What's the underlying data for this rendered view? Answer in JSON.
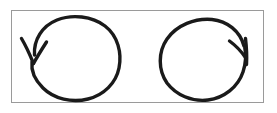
{
  "image": {
    "title": "Two circular rotation arrows",
    "description": "Hand-drawn diagram of two circles, each with an arrowhead indicating direction of rotation, enclosed in a thin rectangular frame.",
    "width": 277,
    "height": 113,
    "background_color": "#ffffff"
  },
  "frame": {
    "name": "bounding-rectangle",
    "x": 11,
    "y": 10,
    "width": 253,
    "height": 93,
    "stroke_color": "#9a9a9a",
    "stroke_width": 1,
    "fill_color": "#ffffff"
  },
  "style": {
    "ink_color": "#1a1a1a",
    "stroke_width": 3.4,
    "stroke_linecap": "round",
    "stroke_linejoin": "round"
  },
  "figures": [
    {
      "id": "left-circle-arrow",
      "label": "counterclockwise rotation arrow",
      "direction": "counterclockwise",
      "center_x": 77,
      "center_y": 59,
      "radius_x": 43,
      "radius_y": 42,
      "arrowhead": {
        "name": "arrowhead-down-left",
        "tip_x": 33,
        "tip_y": 62,
        "barb_one_x": 21,
        "barb_one_y": 38,
        "barb_two_x": 46,
        "barb_two_y": 42,
        "points_toward": "down-left"
      }
    },
    {
      "id": "right-circle-arrow",
      "label": "clockwise rotation arrow",
      "direction": "clockwise",
      "center_x": 202,
      "center_y": 61,
      "radius_x": 43,
      "radius_y": 41,
      "arrowhead": {
        "name": "arrowhead-up-right",
        "tip_x": 245,
        "tip_y": 39,
        "barb_one_x": 230,
        "barb_one_y": 41,
        "barb_two_x": 247,
        "barb_two_y": 63,
        "points_toward": "up-right"
      }
    }
  ]
}
